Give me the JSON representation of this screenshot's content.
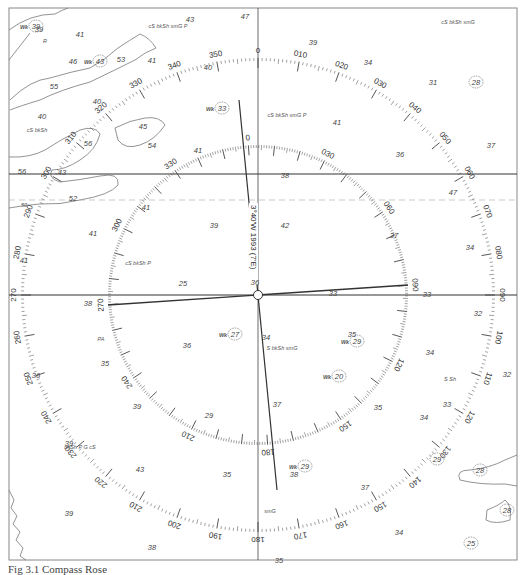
{
  "figure": {
    "caption": "Fig 3.1 Compass Rose",
    "type": "nautical chart compass rose"
  },
  "compass": {
    "center": [
      258,
      295
    ],
    "true_ring": {
      "radius": 237,
      "labels": [
        "0",
        "010",
        "020",
        "030",
        "040",
        "050",
        "060",
        "070",
        "080",
        "090",
        "100",
        "110",
        "120",
        "130",
        "140",
        "150",
        "160",
        "170",
        "180",
        "190",
        "200",
        "210",
        "220",
        "230",
        "240",
        "250",
        "260",
        "270",
        "280",
        "290",
        "300",
        "310",
        "320",
        "330",
        "340",
        "350"
      ]
    },
    "magnetic_ring": {
      "radius": 150,
      "rotation_deg": -3.67,
      "labels": [
        "0",
        "030",
        "060",
        "090",
        "120",
        "150",
        "180",
        "210",
        "240",
        "270",
        "300",
        "330"
      ]
    },
    "variation_text": "3°40'W 1993 (7'E)"
  },
  "soundings": [
    {
      "v": "39",
      "x": 39,
      "y": 32
    },
    {
      "v": "41",
      "x": 80,
      "y": 37
    },
    {
      "v": "43",
      "x": 190,
      "y": 22
    },
    {
      "v": "47",
      "x": 245,
      "y": 19
    },
    {
      "v": "39",
      "x": 313,
      "y": 45
    },
    {
      "v": "46",
      "x": 73,
      "y": 64
    },
    {
      "v": "53",
      "x": 121,
      "y": 62
    },
    {
      "v": "41",
      "x": 152,
      "y": 63
    },
    {
      "v": "40",
      "x": 97,
      "y": 104
    },
    {
      "v": "55",
      "x": 54,
      "y": 89
    },
    {
      "v": "40",
      "x": 42,
      "y": 119
    },
    {
      "v": "40",
      "x": 208,
      "y": 70
    },
    {
      "v": "34",
      "x": 368,
      "y": 65
    },
    {
      "v": "31",
      "x": 433,
      "y": 85
    },
    {
      "v": "56",
      "x": 88,
      "y": 146
    },
    {
      "v": "54",
      "x": 152,
      "y": 148
    },
    {
      "v": "45",
      "x": 143,
      "y": 129
    },
    {
      "v": "41",
      "x": 337,
      "y": 125
    },
    {
      "v": "41",
      "x": 198,
      "y": 153
    },
    {
      "v": "37",
      "x": 491,
      "y": 148
    },
    {
      "v": "36",
      "x": 400,
      "y": 157
    },
    {
      "v": "56",
      "x": 22,
      "y": 174
    },
    {
      "v": "43",
      "x": 62,
      "y": 175
    },
    {
      "v": "38",
      "x": 285,
      "y": 178
    },
    {
      "v": "47",
      "x": 453,
      "y": 195
    },
    {
      "v": "52",
      "x": 73,
      "y": 201
    },
    {
      "v": "41",
      "x": 146,
      "y": 210
    },
    {
      "v": "39",
      "x": 214,
      "y": 228
    },
    {
      "v": "42",
      "x": 285,
      "y": 228
    },
    {
      "v": "37",
      "x": 394,
      "y": 238
    },
    {
      "v": "41",
      "x": 93,
      "y": 236
    },
    {
      "v": "41",
      "x": 24,
      "y": 263
    },
    {
      "v": "34",
      "x": 470,
      "y": 250
    },
    {
      "v": "25",
      "x": 183,
      "y": 286
    },
    {
      "v": "36",
      "x": 255,
      "y": 285
    },
    {
      "v": "33",
      "x": 333,
      "y": 296
    },
    {
      "v": "33",
      "x": 427,
      "y": 297
    },
    {
      "v": "38",
      "x": 88,
      "y": 306
    },
    {
      "v": "32",
      "x": 478,
      "y": 316
    },
    {
      "v": "34",
      "x": 266,
      "y": 340
    },
    {
      "v": "35",
      "x": 352,
      "y": 337
    },
    {
      "v": "36",
      "x": 187,
      "y": 348
    },
    {
      "v": "35",
      "x": 105,
      "y": 366
    },
    {
      "v": "34",
      "x": 430,
      "y": 355
    },
    {
      "v": "36",
      "x": 36,
      "y": 378
    },
    {
      "v": "32",
      "x": 507,
      "y": 377
    },
    {
      "v": "39",
      "x": 137,
      "y": 409
    },
    {
      "v": "37",
      "x": 277,
      "y": 407
    },
    {
      "v": "35",
      "x": 378,
      "y": 410
    },
    {
      "v": "33",
      "x": 447,
      "y": 407
    },
    {
      "v": "34",
      "x": 424,
      "y": 420
    },
    {
      "v": "29",
      "x": 209,
      "y": 418
    },
    {
      "v": "39",
      "x": 69,
      "y": 446
    },
    {
      "v": "35",
      "x": 227,
      "y": 477
    },
    {
      "v": "38",
      "x": 294,
      "y": 477
    },
    {
      "v": "37",
      "x": 365,
      "y": 490
    },
    {
      "v": "39",
      "x": 69,
      "y": 516
    },
    {
      "v": "34",
      "x": 399,
      "y": 535
    },
    {
      "v": "38",
      "x": 152,
      "y": 550
    },
    {
      "v": "35",
      "x": 279,
      "y": 563
    },
    {
      "v": "43",
      "x": 140,
      "y": 472
    }
  ],
  "circled_soundings": [
    {
      "v": "28",
      "x": 476,
      "y": 85
    },
    {
      "v": "29",
      "x": 437,
      "y": 462
    },
    {
      "v": "28",
      "x": 480,
      "y": 473
    },
    {
      "v": "28",
      "x": 507,
      "y": 513
    },
    {
      "v": "25",
      "x": 471,
      "y": 546
    }
  ],
  "wrecks": [
    {
      "label": "Wk",
      "depth": "39",
      "x": 36,
      "y": 29
    },
    {
      "label": "Wk",
      "depth": "43",
      "x": 100,
      "y": 64
    },
    {
      "label": "Wk",
      "depth": "33",
      "x": 222,
      "y": 111
    },
    {
      "label": "Wk",
      "depth": "27",
      "x": 235,
      "y": 337
    },
    {
      "label": "Wk",
      "depth": "29",
      "x": 357,
      "y": 344
    },
    {
      "label": "Wk",
      "depth": "20",
      "x": 339,
      "y": 379
    },
    {
      "label": "Wk",
      "depth": "29",
      "x": 305,
      "y": 469
    }
  ],
  "seabed_notes": [
    {
      "t": "cS bkSh smG P",
      "x": 168,
      "y": 28
    },
    {
      "t": "cS bkSh smG",
      "x": 458,
      "y": 24
    },
    {
      "t": "R",
      "x": 45,
      "y": 43
    },
    {
      "t": "cS bkSh",
      "x": 37,
      "y": 132
    },
    {
      "t": "cS bkSh smG P",
      "x": 287,
      "y": 117
    },
    {
      "t": "cS bkSh P",
      "x": 138,
      "y": 265
    },
    {
      "t": "PA",
      "x": 101,
      "y": 341
    },
    {
      "t": "S bkSh smG",
      "x": 282,
      "y": 350
    },
    {
      "t": "S Sh",
      "x": 450,
      "y": 381
    },
    {
      "t": "bkSh P G cS",
      "x": 80,
      "y": 449
    },
    {
      "t": "smG",
      "x": 270,
      "y": 513
    }
  ],
  "contour_labels": [
    {
      "v": "50",
      "x": 24,
      "y": 207
    }
  ]
}
